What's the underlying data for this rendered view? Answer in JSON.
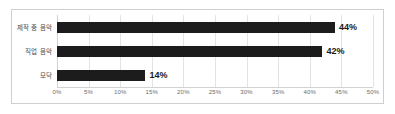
{
  "chart_data": {
    "type": "bar",
    "orientation": "horizontal",
    "title": "",
    "subtitle": "",
    "xlabel": "",
    "ylabel": "",
    "categories": [
      "제작 중 음악",
      "직업 음악",
      "모닥"
    ],
    "values": [
      44,
      42,
      14
    ],
    "value_labels": [
      "44%",
      "42%",
      "14%"
    ],
    "xlim": [
      0,
      50
    ],
    "x_tick_values": [
      0,
      5,
      10,
      15,
      20,
      25,
      30,
      35,
      40,
      45,
      50
    ],
    "x_tick_labels": [
      "0%",
      "5%",
      "10%",
      "15%",
      "20%",
      "25%",
      "30%",
      "35%",
      "40%",
      "45%",
      "50%"
    ],
    "grid": true,
    "grid_axis": "x",
    "legend": false,
    "legend_position": "none",
    "annotations": [],
    "colors": {
      "bar": "#1c1c1c",
      "gridline": "#e3e3e3",
      "axis": "#d2d2d2",
      "frame": "#cfcfcf",
      "background": "#ffffff",
      "value_label_text": "#1a1a1a",
      "category_label_text": "#4a4a4a",
      "tick_label_text": "#6b6b6b"
    }
  }
}
